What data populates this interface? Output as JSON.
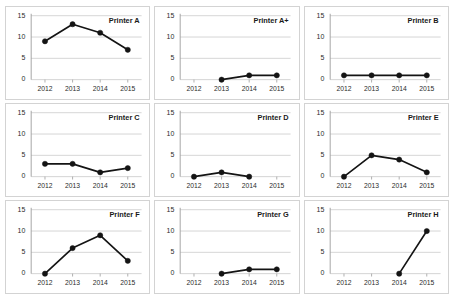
{
  "figure": {
    "layout": "3x3 small-multiples grid",
    "rows": 3,
    "columns": 3,
    "background_color": "#ffffff",
    "line_color": "#141414",
    "gridline_color": "#c8c8c8",
    "axis_color": "#9a9a9a",
    "panel_border_color": "#d3d3d3"
  },
  "chart_data": [
    {
      "type": "line",
      "title": "Printer A",
      "categories": [
        "2012",
        "2013",
        "2014",
        "2015"
      ],
      "x": [
        2012,
        2013,
        2014,
        2015
      ],
      "values": [
        9,
        13,
        11,
        7
      ],
      "xlabel": "",
      "ylabel": "",
      "ylim": [
        0,
        15
      ],
      "yticks": [
        0,
        5,
        10,
        15
      ],
      "grid": true,
      "legend": "none",
      "markers": true
    },
    {
      "type": "line",
      "title": "Printer A+",
      "categories": [
        "2012",
        "2013",
        "2014",
        "2015"
      ],
      "x": [
        2012,
        2013,
        2014,
        2015
      ],
      "values": [
        null,
        0,
        1,
        1
      ],
      "xlabel": "",
      "ylabel": "",
      "ylim": [
        0,
        15
      ],
      "yticks": [
        0,
        5,
        10,
        15
      ],
      "grid": true,
      "legend": "none",
      "markers": true
    },
    {
      "type": "line",
      "title": "Printer B",
      "categories": [
        "2012",
        "2013",
        "2014",
        "2015"
      ],
      "x": [
        2012,
        2013,
        2014,
        2015
      ],
      "values": [
        1,
        1,
        1,
        1
      ],
      "xlabel": "",
      "ylabel": "",
      "ylim": [
        0,
        15
      ],
      "yticks": [
        0,
        5,
        10,
        15
      ],
      "grid": true,
      "legend": "none",
      "markers": true
    },
    {
      "type": "line",
      "title": "Printer C",
      "categories": [
        "2012",
        "2013",
        "2014",
        "2015"
      ],
      "x": [
        2012,
        2013,
        2014,
        2015
      ],
      "values": [
        3,
        3,
        1,
        2
      ],
      "xlabel": "",
      "ylabel": "",
      "ylim": [
        0,
        15
      ],
      "yticks": [
        0,
        5,
        10,
        15
      ],
      "grid": true,
      "legend": "none",
      "markers": true
    },
    {
      "type": "line",
      "title": "Printer D",
      "categories": [
        "2012",
        "2013",
        "2014",
        "2015"
      ],
      "x": [
        2012,
        2013,
        2014,
        2015
      ],
      "values": [
        0,
        1,
        0,
        null
      ],
      "xlabel": "",
      "ylabel": "",
      "ylim": [
        0,
        15
      ],
      "yticks": [
        0,
        5,
        10,
        15
      ],
      "grid": true,
      "legend": "none",
      "markers": true
    },
    {
      "type": "line",
      "title": "Printer E",
      "categories": [
        "2012",
        "2013",
        "2014",
        "2015"
      ],
      "x": [
        2012,
        2013,
        2014,
        2015
      ],
      "values": [
        0,
        5,
        4,
        1
      ],
      "xlabel": "",
      "ylabel": "",
      "ylim": [
        0,
        15
      ],
      "yticks": [
        0,
        5,
        10,
        15
      ],
      "grid": true,
      "legend": "none",
      "markers": true
    },
    {
      "type": "line",
      "title": "Printer F",
      "categories": [
        "2012",
        "2013",
        "2014",
        "2015"
      ],
      "x": [
        2012,
        2013,
        2014,
        2015
      ],
      "values": [
        0,
        6,
        9,
        3
      ],
      "xlabel": "",
      "ylabel": "",
      "ylim": [
        0,
        15
      ],
      "yticks": [
        0,
        5,
        10,
        15
      ],
      "grid": true,
      "legend": "none",
      "markers": true
    },
    {
      "type": "line",
      "title": "Printer G",
      "categories": [
        "2012",
        "2013",
        "2014",
        "2015"
      ],
      "x": [
        2012,
        2013,
        2014,
        2015
      ],
      "values": [
        null,
        0,
        1,
        1
      ],
      "xlabel": "",
      "ylabel": "",
      "ylim": [
        0,
        15
      ],
      "yticks": [
        0,
        5,
        10,
        15
      ],
      "grid": true,
      "legend": "none",
      "markers": true
    },
    {
      "type": "line",
      "title": "Printer H",
      "categories": [
        "2012",
        "2013",
        "2014",
        "2015"
      ],
      "x": [
        2012,
        2013,
        2014,
        2015
      ],
      "values": [
        null,
        null,
        0,
        10
      ],
      "xlabel": "",
      "ylabel": "",
      "ylim": [
        0,
        15
      ],
      "yticks": [
        0,
        5,
        10,
        15
      ],
      "grid": true,
      "legend": "none",
      "markers": true
    }
  ]
}
